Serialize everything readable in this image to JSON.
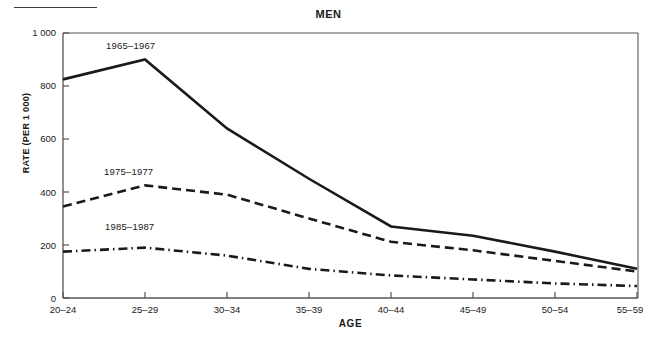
{
  "figure": {
    "title": "MEN",
    "rule_present": true
  },
  "axes": {
    "x_label": "AGE",
    "y_label": "RATE (PER 1 000)",
    "y_ticks": [
      "0",
      "200",
      "400",
      "600",
      "800",
      "1 000"
    ],
    "x_ticks": [
      "20–24",
      "25–29",
      "30–34",
      "35–39",
      "40–44",
      "45–49",
      "50–54",
      "55–59"
    ]
  },
  "series_labels": {
    "s1": "1965–1967",
    "s2": "1975–1977",
    "s3": "1985–1987"
  },
  "chart_data": {
    "type": "line",
    "title": "MEN",
    "xlabel": "AGE",
    "ylabel": "RATE (PER 1 000)",
    "categories": [
      "20–24",
      "25–29",
      "30–34",
      "35–39",
      "40–44",
      "45–49",
      "50–54",
      "55–59"
    ],
    "ylim": [
      0,
      1000
    ],
    "ytick_values": [
      0,
      200,
      400,
      600,
      800,
      1000
    ],
    "grid": false,
    "legend_position": "inline-annotations",
    "series": [
      {
        "name": "1965–1967",
        "style": "solid",
        "values": [
          825,
          900,
          640,
          450,
          270,
          235,
          175,
          110
        ]
      },
      {
        "name": "1975–1977",
        "style": "dashed",
        "values": [
          345,
          425,
          390,
          300,
          212,
          180,
          140,
          100
        ]
      },
      {
        "name": "1985–1987",
        "style": "dash-dot",
        "values": [
          175,
          190,
          160,
          110,
          85,
          70,
          55,
          45
        ]
      }
    ]
  },
  "colors": {
    "line": "#1a1a1a",
    "axis": "#4a4a4a",
    "background": "#ffffff"
  }
}
